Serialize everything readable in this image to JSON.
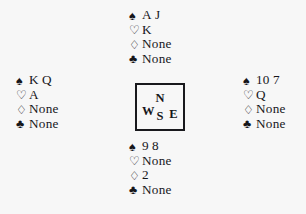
{
  "diagram": {
    "type": "bridge-hand-diagram",
    "suit_symbols": {
      "spade": "♠",
      "heart": "♡",
      "diamond": "♢",
      "club": "♣"
    },
    "none_label": "None",
    "compass": {
      "north": "N",
      "west": "W",
      "east": "E",
      "south": "S"
    },
    "hands": {
      "north": {
        "label": "North",
        "suits": [
          {
            "suit": "spade",
            "symbol": "♠",
            "filled": true,
            "cards": [
              "A",
              "J"
            ]
          },
          {
            "suit": "heart",
            "symbol": "♡",
            "filled": false,
            "cards": [
              "K"
            ]
          },
          {
            "suit": "diamond",
            "symbol": "♢",
            "filled": false,
            "cards": [
              "None"
            ]
          },
          {
            "suit": "club",
            "symbol": "♣",
            "filled": true,
            "cards": [
              "None"
            ]
          }
        ]
      },
      "west": {
        "label": "West",
        "suits": [
          {
            "suit": "spade",
            "symbol": "♠",
            "filled": true,
            "cards": [
              "K",
              "Q"
            ]
          },
          {
            "suit": "heart",
            "symbol": "♡",
            "filled": false,
            "cards": [
              "A"
            ]
          },
          {
            "suit": "diamond",
            "symbol": "♢",
            "filled": false,
            "cards": [
              "None"
            ]
          },
          {
            "suit": "club",
            "symbol": "♣",
            "filled": true,
            "cards": [
              "None"
            ]
          }
        ]
      },
      "east": {
        "label": "East",
        "suits": [
          {
            "suit": "spade",
            "symbol": "♠",
            "filled": true,
            "cards": [
              "10",
              "7"
            ]
          },
          {
            "suit": "heart",
            "symbol": "♡",
            "filled": false,
            "cards": [
              "Q"
            ]
          },
          {
            "suit": "diamond",
            "symbol": "♢",
            "filled": false,
            "cards": [
              "None"
            ]
          },
          {
            "suit": "club",
            "symbol": "♣",
            "filled": true,
            "cards": [
              "None"
            ]
          }
        ]
      },
      "south": {
        "label": "South",
        "suits": [
          {
            "suit": "spade",
            "symbol": "♠",
            "filled": true,
            "cards": [
              "9",
              "8"
            ]
          },
          {
            "suit": "heart",
            "symbol": "♡",
            "filled": false,
            "cards": [
              "None"
            ]
          },
          {
            "suit": "diamond",
            "symbol": "♢",
            "filled": false,
            "cards": [
              "2"
            ]
          },
          {
            "suit": "club",
            "symbol": "♣",
            "filled": true,
            "cards": [
              "None"
            ]
          }
        ]
      }
    }
  }
}
